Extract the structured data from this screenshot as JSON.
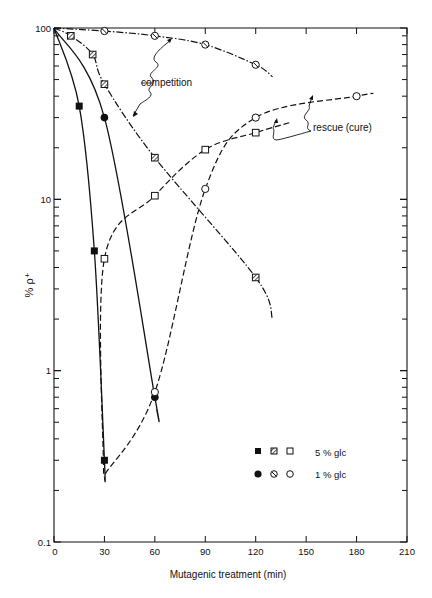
{
  "chart_data": {
    "type": "line",
    "title": "",
    "xlabel": "Mutagenic treatment (min)",
    "ylabel": "% ρ⁺",
    "xlim": [
      0,
      210
    ],
    "ylim": [
      0.1,
      100
    ],
    "yscale": "log",
    "x_ticks": [
      0,
      30,
      60,
      90,
      120,
      150,
      180,
      210
    ],
    "x_tick_labels": [
      "0",
      "30",
      "60",
      "90",
      "120",
      "150",
      "180",
      "210"
    ],
    "y_tick_labels": [
      "0.1",
      "1",
      "10",
      "100"
    ],
    "grid": false,
    "legend": {
      "position": "lower right",
      "rows": [
        {
          "label": "5 % glc",
          "markers": [
            "filled-square",
            "hatched-square",
            "open-square"
          ]
        },
        {
          "label": "1 % glc",
          "markers": [
            "filled-circle",
            "hatched-circle",
            "open-circle"
          ]
        }
      ]
    },
    "annotations": [
      {
        "text": "competition",
        "x": 110,
        "y": 55
      },
      {
        "text": "rescue (cure)",
        "x": 165,
        "y": 26
      }
    ],
    "series": [
      {
        "name": "5 % glc survival (filled squares)",
        "marker": "filled-square",
        "line": "solid",
        "x": [
          0,
          15,
          24,
          30
        ],
        "y": [
          100,
          35,
          5,
          0.3
        ]
      },
      {
        "name": "1 % glc survival (filled circles)",
        "marker": "filled-circle",
        "line": "solid",
        "x": [
          0,
          30,
          60
        ],
        "y": [
          100,
          30,
          0.7
        ]
      },
      {
        "name": "5 % glc competition (hatched squares)",
        "marker": "hatched-square",
        "line": "dash-dot",
        "x": [
          0,
          10,
          23,
          30,
          60,
          120
        ],
        "y": [
          100,
          90,
          70,
          47,
          17.5,
          3.5
        ]
      },
      {
        "name": "1 % glc competition (hatched circles)",
        "marker": "hatched-circle",
        "line": "dash-dot",
        "x": [
          0,
          30,
          60,
          90,
          120
        ],
        "y": [
          100,
          96,
          90,
          80,
          61
        ]
      },
      {
        "name": "5 % glc rescue (open squares)",
        "marker": "open-square",
        "line": "dashed",
        "x": [
          30,
          60,
          90,
          120
        ],
        "y": [
          4.5,
          10.5,
          19.5,
          24.5
        ]
      },
      {
        "name": "1 % glc rescue (open circles)",
        "marker": "open-circle",
        "line": "dashed",
        "x": [
          60,
          90,
          120,
          180
        ],
        "y": [
          0.75,
          11.5,
          30,
          40
        ]
      }
    ]
  },
  "labels": {
    "competition": "competition",
    "rescue": "rescue (cure)",
    "legend_5": "5 % glc",
    "legend_1": "1 % glc",
    "xlabel": "Mutagenic treatment (min)",
    "ylabel": "% ρ⁺"
  }
}
